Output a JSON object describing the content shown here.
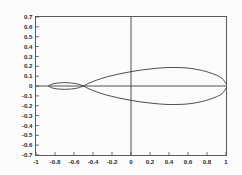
{
  "chart_data": {
    "type": "line",
    "title": "",
    "subtitle": "",
    "xlabel": "",
    "ylabel": "",
    "xlim": [
      -1,
      1
    ],
    "ylim": [
      -0.7,
      0.7
    ],
    "grid": false,
    "legend": null,
    "axis_lines": {
      "x_zero": 0,
      "y_zero": 0
    },
    "xticks": [
      -1,
      -0.8,
      -0.6,
      -0.4,
      -0.2,
      0,
      0.2,
      0.4,
      0.6,
      0.8,
      1
    ],
    "xticklabels": [
      "-1",
      "-0.8",
      "-0.6",
      "-0.4",
      "-0.2",
      "0",
      "0.2",
      "0.4",
      "0.6",
      "0.8",
      "1"
    ],
    "yticks": [
      -0.7,
      -0.6,
      -0.5,
      -0.4,
      -0.3,
      -0.2,
      -0.1,
      0,
      0.1,
      0.2,
      0.3,
      0.4,
      0.5,
      0.6,
      0.7
    ],
    "yticklabels": [
      "-0.7",
      "-0.6",
      "-0.5",
      "-0.4",
      "-0.3",
      "-0.2",
      "-0.1",
      "0",
      "0.1",
      "0.2",
      "0.3",
      "0.4",
      "0.5",
      "0.6",
      "0.7"
    ],
    "series": [
      {
        "name": "large-lens-upper",
        "x": [
          -0.5,
          -0.44,
          -0.36,
          -0.26,
          -0.14,
          -0.02,
          0.1,
          0.22,
          0.34,
          0.44,
          0.54,
          0.64,
          0.74,
          0.82,
          0.9,
          0.96,
          1.0
        ],
        "y": [
          0.0,
          0.03,
          0.06,
          0.091,
          0.119,
          0.142,
          0.161,
          0.175,
          0.185,
          0.188,
          0.186,
          0.177,
          0.159,
          0.138,
          0.109,
          0.077,
          0.022
        ]
      },
      {
        "name": "large-lens-lower",
        "x": [
          -0.5,
          -0.44,
          -0.36,
          -0.26,
          -0.14,
          -0.02,
          0.1,
          0.22,
          0.34,
          0.44,
          0.54,
          0.64,
          0.74,
          0.82,
          0.9,
          0.96,
          1.0
        ],
        "y": [
          0.0,
          -0.03,
          -0.06,
          -0.091,
          -0.119,
          -0.142,
          -0.161,
          -0.175,
          -0.185,
          -0.188,
          -0.186,
          -0.177,
          -0.159,
          -0.138,
          -0.109,
          -0.077,
          -0.022
        ]
      },
      {
        "name": "small-lens-upper",
        "x": [
          -0.87,
          -0.84,
          -0.8,
          -0.75,
          -0.7,
          -0.65,
          -0.6,
          -0.56,
          -0.53,
          -0.5
        ],
        "y": [
          0.0,
          0.016,
          0.026,
          0.032,
          0.034,
          0.032,
          0.027,
          0.02,
          0.011,
          0.0
        ]
      },
      {
        "name": "small-lens-lower",
        "x": [
          -0.87,
          -0.84,
          -0.8,
          -0.75,
          -0.7,
          -0.65,
          -0.6,
          -0.56,
          -0.53,
          -0.5
        ],
        "y": [
          0.0,
          -0.016,
          -0.026,
          -0.032,
          -0.034,
          -0.032,
          -0.027,
          -0.02,
          -0.011,
          0.0
        ]
      }
    ],
    "colors": {
      "curve": "#2e2e2e",
      "axis": "#3c3c3c",
      "frame": "#4a4a4a",
      "text": "#2b2b2b",
      "background": "#fdfdfd"
    }
  }
}
